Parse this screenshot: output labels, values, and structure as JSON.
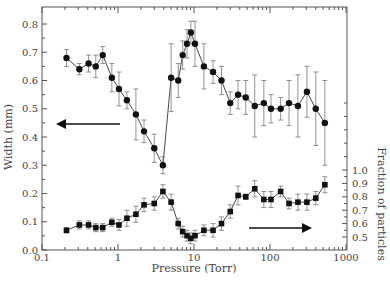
{
  "chart_data": {
    "type": "line",
    "title": "",
    "xlabel": "Pressure (Torr)",
    "ylabel": "Width (mm)",
    "ylabel_right": "Fraction of particles",
    "xscale": "log",
    "xlim": [
      0.1,
      1000
    ],
    "ylim": [
      0.0,
      0.8
    ],
    "ylim_right": [
      0.5,
      1.0
    ],
    "x_ticks": [
      "0.1",
      "1",
      "10",
      "100",
      "1000"
    ],
    "y_ticks": [
      "0.0",
      "0.1",
      "0.2",
      "0.3",
      "0.4",
      "0.5",
      "0.6",
      "0.7",
      "0.8"
    ],
    "y_ticks_right": [
      "0.5",
      "0.6",
      "0.7",
      "0.8",
      "0.9",
      "1.0"
    ],
    "grid": false,
    "legend": "none; arrows indicate axis for each series",
    "series": [
      {
        "name": "Width (mm)",
        "marker": "circle",
        "axis": "left",
        "x": [
          0.21,
          0.31,
          0.41,
          0.51,
          0.63,
          0.83,
          1.03,
          1.31,
          1.72,
          2.2,
          3.0,
          3.9,
          5.0,
          6.2,
          7.1,
          8.1,
          9.1,
          10.3,
          13.5,
          17.8,
          23,
          30,
          38,
          48,
          63,
          83,
          103,
          138,
          178,
          233,
          306,
          400,
          527
        ],
        "y": [
          0.68,
          0.64,
          0.66,
          0.65,
          0.69,
          0.61,
          0.57,
          0.53,
          0.48,
          0.42,
          0.36,
          0.3,
          0.61,
          0.6,
          0.69,
          0.73,
          0.77,
          0.73,
          0.65,
          0.63,
          0.6,
          0.52,
          0.55,
          0.54,
          0.51,
          0.52,
          0.5,
          0.5,
          0.52,
          0.51,
          0.56,
          0.5,
          0.45
        ],
        "err": [
          0.03,
          0.02,
          0.03,
          0.04,
          0.03,
          0.05,
          0.06,
          0.03,
          0.09,
          0.04,
          0.05,
          0.03,
          0.12,
          0.06,
          0.05,
          0.05,
          0.04,
          0.08,
          0.08,
          0.04,
          0.05,
          0.04,
          0.05,
          0.06,
          0.11,
          0.08,
          0.05,
          0.04,
          0.08,
          0.11,
          0.09,
          0.13,
          0.15
        ]
      },
      {
        "name": "Fraction of particles",
        "marker": "square",
        "axis": "right",
        "x": [
          0.21,
          0.31,
          0.41,
          0.51,
          0.63,
          0.83,
          1.03,
          1.31,
          1.72,
          2.2,
          3.0,
          3.9,
          5.0,
          6.2,
          7.1,
          8.1,
          9.1,
          10.3,
          13.5,
          17.8,
          23,
          30,
          38,
          48,
          63,
          83,
          103,
          138,
          178,
          233,
          306,
          400,
          527
        ],
        "y": [
          0.55,
          0.59,
          0.59,
          0.57,
          0.57,
          0.61,
          0.59,
          0.64,
          0.67,
          0.74,
          0.75,
          0.84,
          0.76,
          0.6,
          0.54,
          0.51,
          0.49,
          0.51,
          0.55,
          0.55,
          0.6,
          0.69,
          0.81,
          0.8,
          0.86,
          0.78,
          0.78,
          0.84,
          0.75,
          0.76,
          0.76,
          0.79,
          0.89
        ],
        "err": [
          0.02,
          0.03,
          0.03,
          0.03,
          0.03,
          0.03,
          0.04,
          0.06,
          0.06,
          0.05,
          0.05,
          0.05,
          0.06,
          0.04,
          0.04,
          0.04,
          0.04,
          0.04,
          0.04,
          0.05,
          0.05,
          0.05,
          0.07,
          0.02,
          0.06,
          0.06,
          0.06,
          0.04,
          0.04,
          0.06,
          0.06,
          0.05,
          0.06
        ]
      }
    ],
    "annotations": [
      {
        "type": "arrow",
        "direction": "left",
        "refers_to": "Width (mm)"
      },
      {
        "type": "arrow",
        "direction": "right",
        "refers_to": "Fraction of particles"
      }
    ]
  }
}
